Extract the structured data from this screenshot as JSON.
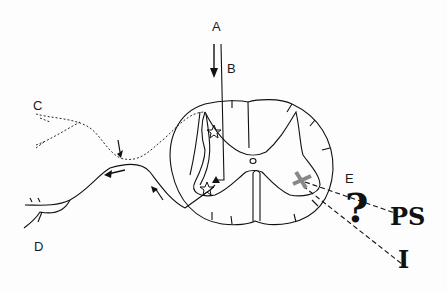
{
  "diagram": {
    "type": "spinal-cord-cross-section",
    "labels": {
      "A": "A",
      "B": "B",
      "C": "C",
      "D": "D",
      "E": "E",
      "question": "?",
      "PS": "PS",
      "I": "I"
    },
    "colors": {
      "line": "#111111",
      "lesion_mark": "#888888",
      "background": "#fdfdfd"
    },
    "elements": [
      {
        "id": "A",
        "desc": "descending arrow from top into cord"
      },
      {
        "id": "B",
        "desc": "vertical fiber entering dorsal cord"
      },
      {
        "id": "C",
        "desc": "dashed afferent fiber from periphery"
      },
      {
        "id": "D",
        "desc": "solid efferent fiber to periphery"
      },
      {
        "id": "E",
        "desc": "grey cross lesion in ventral horn with dashed lines to ? / PS / I"
      }
    ]
  }
}
